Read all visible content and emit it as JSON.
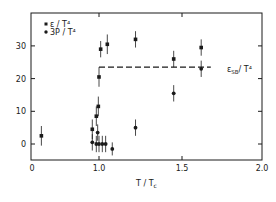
{
  "chart_data": {
    "type": "scatter",
    "title": "",
    "xlabel": "T / T_c",
    "ylabel": "",
    "x_ticks": [
      {
        "value": 0,
        "label": "0"
      },
      {
        "value": 1.0,
        "label": "1.0"
      },
      {
        "value": 1.5,
        "label": "1.5"
      },
      {
        "value": 2.0,
        "label": "2.0"
      }
    ],
    "y_ticks": [
      {
        "value": 0,
        "label": "0"
      },
      {
        "value": 10,
        "label": "10"
      },
      {
        "value": 20,
        "label": "20"
      },
      {
        "value": 30,
        "label": "30"
      }
    ],
    "ylim": [
      -5,
      40
    ],
    "xlim": [
      0,
      2.0
    ],
    "grid": false,
    "legend_position": "upper left",
    "series": [
      {
        "name": "ε/T⁴",
        "marker": "square",
        "points": [
          {
            "x": 0.14,
            "y": 2.5,
            "err": 3
          },
          {
            "x": 0.9,
            "y": 4.5,
            "err": 3
          },
          {
            "x": 0.96,
            "y": 8.5,
            "err": 3
          },
          {
            "x": 0.99,
            "y": 11.5,
            "err": 3
          },
          {
            "x": 1.0,
            "y": 20.5,
            "err": 3
          },
          {
            "x": 1.01,
            "y": 29.0,
            "err": 2.5
          },
          {
            "x": 1.05,
            "y": 30.5,
            "err": 3
          },
          {
            "x": 1.22,
            "y": 32.0,
            "err": 2.5
          },
          {
            "x": 1.45,
            "y": 26.0,
            "err": 2.5
          },
          {
            "x": 1.62,
            "y": 29.5,
            "err": 2.5
          }
        ]
      },
      {
        "name": "3P/T⁴",
        "marker": "circle",
        "points": [
          {
            "x": 0.9,
            "y": 0.5,
            "err": 2.5
          },
          {
            "x": 0.96,
            "y": 0.0,
            "err": 2.5
          },
          {
            "x": 0.98,
            "y": 3.5,
            "err": 2.5
          },
          {
            "x": 1.0,
            "y": 0.0,
            "err": 2.5
          },
          {
            "x": 1.02,
            "y": 0.0,
            "err": 2.5
          },
          {
            "x": 1.04,
            "y": 0.0,
            "err": 2.5
          },
          {
            "x": 1.08,
            "y": -1.5,
            "err": 2
          },
          {
            "x": 1.22,
            "y": 5.0,
            "err": 2.5
          },
          {
            "x": 1.45,
            "y": 15.5,
            "err": 2.5
          },
          {
            "x": 1.62,
            "y": 23.0,
            "err": 2.5
          }
        ]
      }
    ],
    "reference_line": {
      "label": "ε_SB/T⁴",
      "y": 23.5,
      "x_start": 1.0,
      "x_end": 1.68,
      "style": "dashed"
    },
    "annotations": [
      "ε_SB/T⁴"
    ]
  },
  "legend": {
    "item1": "ε / T⁴",
    "item2": "3P / T⁴"
  },
  "axes": {
    "xlabel_main": "T / T",
    "xlabel_sub": "c",
    "sb_label_main": "ε",
    "sb_label_sub": "SB",
    "sb_label_tail": "/ T⁴"
  }
}
